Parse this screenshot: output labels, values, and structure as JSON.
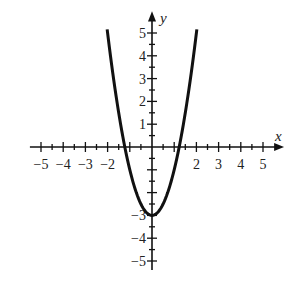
{
  "chart_data": {
    "type": "line",
    "title": "",
    "xlabel": "x",
    "ylabel": "y",
    "xlim": [
      -5.5,
      5.8
    ],
    "ylim": [
      -5.5,
      5.8
    ],
    "grid": false,
    "x_ticks": [
      -5,
      -4,
      -3,
      -2,
      -1,
      0,
      1,
      2,
      3,
      4,
      5
    ],
    "y_ticks": [
      -5,
      -4,
      -3,
      -2,
      -1,
      0,
      1,
      2,
      3,
      4,
      5
    ],
    "x_tick_labels": [
      "−5",
      "−4",
      "−3",
      "−2",
      "2",
      "3",
      "4",
      "5"
    ],
    "y_tick_labels": [
      "5",
      "4",
      "3",
      "2",
      "1",
      "−3",
      "−4",
      "−5"
    ],
    "minor_tick_step": 0.5,
    "series": [
      {
        "name": "y = 2x^2 - 3",
        "x": [
          -2,
          -1.5,
          -1,
          -0.5,
          0,
          0.5,
          1,
          1.5,
          2
        ],
        "y": [
          5,
          1.5,
          -1,
          -2.5,
          -3,
          -2.5,
          -1,
          1.5,
          5
        ]
      }
    ]
  },
  "labels": {
    "x_axis": "x",
    "y_axis": "y"
  }
}
